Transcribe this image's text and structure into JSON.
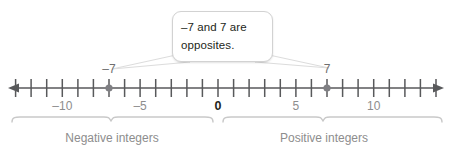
{
  "figure": {
    "type": "number-line-diagram",
    "width": 455,
    "height": 156,
    "background": "#ffffff"
  },
  "callout": {
    "line1": "–7 and 7 are",
    "line2": "opposites.",
    "full_text": "–7 and 7 are opposites.",
    "border_color": "#d2d2d2",
    "fill_color": "#ffffff",
    "text_color": "#231f20"
  },
  "number_line": {
    "axis_color": "#58595b",
    "tick_color": "#58595b",
    "left_arrow": "left-arrowhead",
    "right_arrow": "right-arrowhead",
    "origin_value": 0,
    "min_tick": -13,
    "max_tick": 14,
    "labels": [
      {
        "value": -10,
        "text": "–10"
      },
      {
        "value": -5,
        "text": "–5"
      },
      {
        "value": 0,
        "text": "0"
      },
      {
        "value": 5,
        "text": "5"
      },
      {
        "value": 10,
        "text": "10"
      }
    ],
    "zero_label_emphasis": true,
    "plotted_points": [
      {
        "value": -7,
        "label": "–7",
        "color": "#7f7f83"
      },
      {
        "value": 7,
        "label": "7",
        "color": "#7f7f83"
      }
    ]
  },
  "braces": {
    "color": "#c9c9c9",
    "negative": {
      "label": "Negative integers",
      "from_value": -13.35,
      "to_value": 0
    },
    "positive": {
      "label": "Positive integers",
      "from_value": 0,
      "to_value": 14.4
    }
  }
}
